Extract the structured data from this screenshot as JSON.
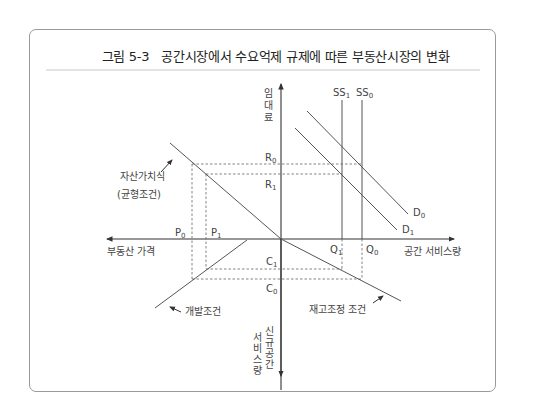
{
  "figure": {
    "number": "그림 5-3",
    "title": "공간시장에서 수요억제 규제에 따른 부동산시장의 변화"
  },
  "axes": {
    "vertical_up_label": [
      "임",
      "대",
      "료"
    ],
    "vertical_down_label_col1": [
      "신",
      "규",
      "공",
      "간"
    ],
    "vertical_down_label_col2": [
      "서",
      "비",
      "스",
      "량"
    ],
    "horizontal_right_label": "공간 서비스량",
    "horizontal_left_label": "부동산 가격"
  },
  "curves": {
    "supply_0": {
      "base": "SS",
      "sub": "0"
    },
    "supply_1": {
      "base": "SS",
      "sub": "1"
    },
    "demand_0": {
      "base": "D",
      "sub": "0"
    },
    "demand_1": {
      "base": "D",
      "sub": "1"
    },
    "asset_value_label": "자산가치식",
    "asset_value_sublabel": "(균형조건)",
    "development_label": "개발조건",
    "stock_adjustment_label": "재고조정 조건"
  },
  "points": {
    "R0": {
      "base": "R",
      "sub": "0"
    },
    "R1": {
      "base": "R",
      "sub": "1"
    },
    "P0": {
      "base": "P",
      "sub": "0"
    },
    "P1": {
      "base": "P",
      "sub": "1"
    },
    "Q0": {
      "base": "Q",
      "sub": "0"
    },
    "Q1": {
      "base": "Q",
      "sub": "1"
    },
    "C0": {
      "base": "C",
      "sub": "0"
    },
    "C1": {
      "base": "C",
      "sub": "1"
    }
  },
  "colors": {
    "line": "#555555",
    "frame": "#9a9a9a",
    "text": "#444444"
  }
}
